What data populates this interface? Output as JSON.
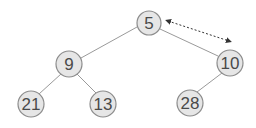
{
  "diagram": {
    "type": "binary-heap-tree",
    "nodes": [
      {
        "id": "n5",
        "label": "5",
        "cx": 149,
        "cy": 23,
        "r": 12
      },
      {
        "id": "n9",
        "label": "9",
        "cx": 69,
        "cy": 64,
        "r": 13
      },
      {
        "id": "n10",
        "label": "10",
        "cx": 230,
        "cy": 63,
        "r": 13
      },
      {
        "id": "n21",
        "label": "21",
        "cx": 31,
        "cy": 104,
        "r": 13
      },
      {
        "id": "n13",
        "label": "13",
        "cx": 103,
        "cy": 104,
        "r": 13
      },
      {
        "id": "n28",
        "label": "28",
        "cx": 190,
        "cy": 103,
        "r": 13
      }
    ],
    "edges": [
      {
        "from": "5",
        "to": "9"
      },
      {
        "from": "5",
        "to": "10"
      },
      {
        "from": "9",
        "to": "21"
      },
      {
        "from": "9",
        "to": "13"
      },
      {
        "from": "10",
        "to": "28"
      }
    ],
    "swap_arrow": {
      "between": [
        "5",
        "10"
      ],
      "style": "dashed double-headed"
    },
    "colors": {
      "node_fill": "#e6e6e6",
      "node_stroke": "#8c8c8c",
      "edge": "#9a9a9a",
      "arrow": "#333333",
      "text": "#4a4a4a"
    }
  }
}
